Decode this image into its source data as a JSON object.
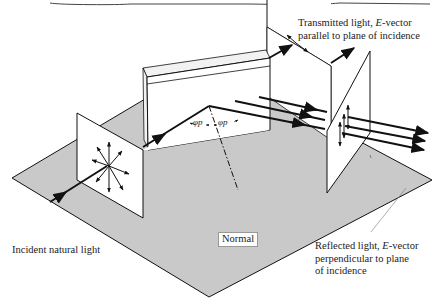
{
  "figure": {
    "type": "physics-diagram",
    "colors": {
      "floor": "#c8c8c8",
      "line": "#111111",
      "panel": "#ffffff",
      "guide": "#777777"
    }
  },
  "labels": {
    "transmitted_line1_prefix": "Transmitted light, ",
    "transmitted_line1_E": "E",
    "transmitted_line1_suffix": "-vector",
    "transmitted_line2": "parallel to plane of incidence",
    "incident": "Incident natural light",
    "normal": "Normal",
    "reflected_line1_prefix": "Reflected light, ",
    "reflected_line1_E": "E",
    "reflected_line1_suffix": "-vector",
    "reflected_line2": "perpendicular to plane",
    "reflected_line3": "of incidence",
    "phi_left": "φp",
    "phi_right": "φp"
  }
}
